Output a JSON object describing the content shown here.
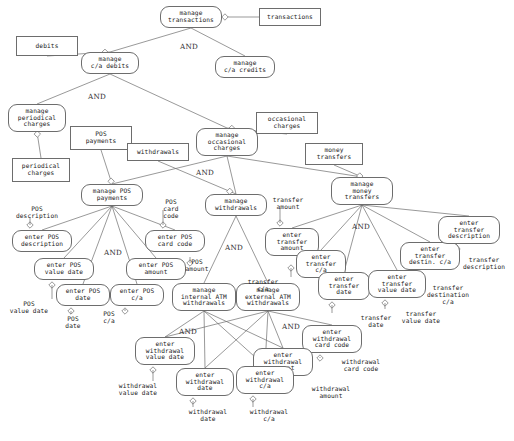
{
  "diagram": {
    "kind": "goal-decomposition-graph",
    "decomposition_operator": "AND",
    "stroke_color": "#6d6d6d",
    "text_color": "#1a1a1a",
    "background": "#ffffff"
  },
  "goals": [
    {
      "id": "g_manage_transactions",
      "label": "manage\ntransactions",
      "x": 160,
      "y": 6,
      "w": 62,
      "h": 22
    },
    {
      "id": "g_manage_ca_debits",
      "label": "manage\nc/a debits",
      "x": 81,
      "y": 52,
      "w": 58,
      "h": 22
    },
    {
      "id": "g_manage_ca_credits",
      "label": "manage\nc/a credits",
      "x": 215,
      "y": 56,
      "w": 60,
      "h": 22
    },
    {
      "id": "g_manage_periodical_charges",
      "label": "manage\nperiodical\ncharges",
      "x": 8,
      "y": 104,
      "w": 58,
      "h": 28
    },
    {
      "id": "g_manage_occasional_charges",
      "label": "manage\noccasional\ncharges",
      "x": 196,
      "y": 128,
      "w": 62,
      "h": 28
    },
    {
      "id": "g_manage_pos_payments",
      "label": "manage POS\npayments",
      "x": 81,
      "y": 184,
      "w": 62,
      "h": 22
    },
    {
      "id": "g_manage_withdrawals",
      "label": "manage\nwithdrawals",
      "x": 205,
      "y": 194,
      "w": 62,
      "h": 22
    },
    {
      "id": "g_manage_money_transfers",
      "label": "manage\nmoney\ntransfers",
      "x": 331,
      "y": 177,
      "w": 62,
      "h": 28
    },
    {
      "id": "g_enter_pos_description",
      "label": "enter POS\ndescription",
      "x": 12,
      "y": 230,
      "w": 60,
      "h": 22
    },
    {
      "id": "g_enter_pos_card_code",
      "label": "enter POS\ncard code",
      "x": 145,
      "y": 230,
      "w": 60,
      "h": 22
    },
    {
      "id": "g_enter_pos_value_date",
      "label": "enter POS\nvalue date",
      "x": 34,
      "y": 258,
      "w": 60,
      "h": 22
    },
    {
      "id": "g_enter_pos_amount",
      "label": "enter POS\namount",
      "x": 126,
      "y": 258,
      "w": 60,
      "h": 22
    },
    {
      "id": "g_enter_pos_date",
      "label": "enter POS\ndate",
      "x": 56,
      "y": 284,
      "w": 54,
      "h": 22
    },
    {
      "id": "g_enter_pos_ca",
      "label": "enter POS\nc/a",
      "x": 110,
      "y": 284,
      "w": 54,
      "h": 22
    },
    {
      "id": "g_manage_internal_atm",
      "label": "manage\ninternal ATM\nwithdrawals",
      "x": 172,
      "y": 283,
      "w": 64,
      "h": 28
    },
    {
      "id": "g_manage_external_atm",
      "label": "manage\nexternal ATM\nwithdrawals",
      "x": 236,
      "y": 283,
      "w": 64,
      "h": 28
    },
    {
      "id": "g_enter_transfer_amount",
      "label": "enter\ntransfer\namount",
      "x": 265,
      "y": 228,
      "w": 54,
      "h": 28
    },
    {
      "id": "g_enter_transfer_ca",
      "label": "enter\ntransfer\nc/a",
      "x": 296,
      "y": 250,
      "w": 50,
      "h": 28
    },
    {
      "id": "g_enter_transfer_date",
      "label": "enter\ntransfer\ndate",
      "x": 318,
      "y": 272,
      "w": 52,
      "h": 28
    },
    {
      "id": "g_enter_transfer_value_date",
      "label": "enter\ntransfer\nvalue date",
      "x": 368,
      "y": 270,
      "w": 58,
      "h": 28
    },
    {
      "id": "g_enter_transfer_destin_ca",
      "label": "enter\ntransfer\ndestin. c/a",
      "x": 400,
      "y": 242,
      "w": 60,
      "h": 28
    },
    {
      "id": "g_enter_transfer_description",
      "label": "enter\ntransfer\ndescription",
      "x": 438,
      "y": 216,
      "w": 62,
      "h": 28
    },
    {
      "id": "g_enter_withdrawal_value_date",
      "label": "enter\nwithdrawal\nvalue date",
      "x": 135,
      "y": 337,
      "w": 60,
      "h": 28
    },
    {
      "id": "g_enter_withdrawal_card_code",
      "label": "enter\nwithdrawal\ncard code",
      "x": 302,
      "y": 325,
      "w": 60,
      "h": 28
    },
    {
      "id": "g_enter_withdrawal_amount",
      "label": "enter\nwithdrawal\namount",
      "x": 253,
      "y": 348,
      "w": 60,
      "h": 28
    },
    {
      "id": "g_enter_withdrawal_date",
      "label": "enter\nwithdrawal\ndate",
      "x": 176,
      "y": 368,
      "w": 58,
      "h": 28
    },
    {
      "id": "g_enter_withdrawal_ca",
      "label": "enter\nwithdrawal\nc/a",
      "x": 236,
      "y": 366,
      "w": 58,
      "h": 28
    }
  ],
  "domain_boxes": [
    {
      "id": "d_transactions",
      "label": "transactions",
      "x": 259,
      "y": 8,
      "w": 62,
      "h": 18
    },
    {
      "id": "d_debits",
      "label": "debits",
      "x": 16,
      "y": 36,
      "w": 62,
      "h": 20
    },
    {
      "id": "d_pos_payments",
      "label": "POS\npayments",
      "x": 70,
      "y": 126,
      "w": 62,
      "h": 24
    },
    {
      "id": "d_withdrawals",
      "label": "withdrawals",
      "x": 127,
      "y": 143,
      "w": 62,
      "h": 18
    },
    {
      "id": "d_occasional_charges",
      "label": "occasional\ncharges",
      "x": 256,
      "y": 112,
      "w": 62,
      "h": 22
    },
    {
      "id": "d_money_transfers",
      "label": "money\ntransfers",
      "x": 305,
      "y": 143,
      "w": 58,
      "h": 22
    },
    {
      "id": "d_periodical_charges",
      "label": "periodical\ncharges",
      "x": 12,
      "y": 158,
      "w": 58,
      "h": 24
    }
  ],
  "resource_labels": [
    {
      "id": "r_pos_description",
      "label": "POS\ndescription",
      "x": 6,
      "y": 205,
      "w": 62
    },
    {
      "id": "r_pos_card_code",
      "label": "POS\ncard\ncode",
      "x": 151,
      "y": 198,
      "w": 40
    },
    {
      "id": "r_pos_amount",
      "label": "POS\namount",
      "x": 180,
      "y": 258,
      "w": 34
    },
    {
      "id": "r_pos_value_date",
      "label": "POS\nvalue date",
      "x": 2,
      "y": 300,
      "w": 54
    },
    {
      "id": "r_pos_date",
      "label": "POS\ndate",
      "x": 57,
      "y": 315,
      "w": 32
    },
    {
      "id": "r_pos_ca",
      "label": "POS\nc/a",
      "x": 93,
      "y": 310,
      "w": 32
    },
    {
      "id": "r_transfer_amount",
      "label": "transfer\namount",
      "x": 264,
      "y": 196,
      "w": 48
    },
    {
      "id": "r_transfer_ca",
      "label": "transfer\nc/a",
      "x": 241,
      "y": 278,
      "w": 44
    },
    {
      "id": "r_transfer_date",
      "label": "transfer\ndate",
      "x": 353,
      "y": 314,
      "w": 46
    },
    {
      "id": "r_transfer_value_date",
      "label": "transfer\nvalue date",
      "x": 395,
      "y": 310,
      "w": 52
    },
    {
      "id": "r_transfer_destination_ca",
      "label": "transfer\ndestination\nc/a",
      "x": 419,
      "y": 284,
      "w": 58
    },
    {
      "id": "r_transfer_description",
      "label": "transfer\ndescription",
      "x": 456,
      "y": 256,
      "w": 56
    },
    {
      "id": "r_withdrawal_value_date",
      "label": "withdrawal\nvalue date",
      "x": 107,
      "y": 382,
      "w": 62
    },
    {
      "id": "r_withdrawal_card_code",
      "label": "withdrawal\ncard code",
      "x": 330,
      "y": 358,
      "w": 62
    },
    {
      "id": "r_withdrawal_amount",
      "label": "withdrawal\namount",
      "x": 300,
      "y": 385,
      "w": 62
    },
    {
      "id": "r_withdrawal_date",
      "label": "withdrawal\ndate",
      "x": 177,
      "y": 408,
      "w": 62
    },
    {
      "id": "r_withdrawal_ca",
      "label": "withdrawal\nc/a",
      "x": 240,
      "y": 408,
      "w": 58
    }
  ],
  "and_markers": [
    {
      "id": "and_transactions",
      "label": "AND",
      "x": 180,
      "y": 42
    },
    {
      "id": "and_ca_debits",
      "label": "AND",
      "x": 88,
      "y": 92
    },
    {
      "id": "and_occasional",
      "label": "AND",
      "x": 196,
      "y": 168
    },
    {
      "id": "and_pos_payments",
      "label": "AND",
      "x": 104,
      "y": 248
    },
    {
      "id": "and_withdrawals",
      "label": "AND",
      "x": 225,
      "y": 243
    },
    {
      "id": "and_money",
      "label": "AND",
      "x": 352,
      "y": 222
    },
    {
      "id": "and_internal_atm",
      "label": "AND",
      "x": 179,
      "y": 327
    },
    {
      "id": "and_external_atm",
      "label": "AND",
      "x": 282,
      "y": 322
    }
  ],
  "edges": [
    {
      "from": "g_manage_transactions",
      "to": "g_manage_ca_debits"
    },
    {
      "from": "g_manage_transactions",
      "to": "g_manage_ca_credits"
    },
    {
      "from": "g_manage_ca_debits",
      "to": "g_manage_periodical_charges"
    },
    {
      "from": "g_manage_ca_debits",
      "to": "g_manage_occasional_charges"
    },
    {
      "from": "g_manage_occasional_charges",
      "to": "g_manage_pos_payments"
    },
    {
      "from": "g_manage_occasional_charges",
      "to": "g_manage_withdrawals"
    },
    {
      "from": "g_manage_occasional_charges",
      "to": "g_manage_money_transfers"
    },
    {
      "from": "g_manage_pos_payments",
      "to": "g_enter_pos_description"
    },
    {
      "from": "g_manage_pos_payments",
      "to": "g_enter_pos_card_code"
    },
    {
      "from": "g_manage_pos_payments",
      "to": "g_enter_pos_value_date"
    },
    {
      "from": "g_manage_pos_payments",
      "to": "g_enter_pos_amount"
    },
    {
      "from": "g_manage_pos_payments",
      "to": "g_enter_pos_date"
    },
    {
      "from": "g_manage_pos_payments",
      "to": "g_enter_pos_ca"
    },
    {
      "from": "g_manage_withdrawals",
      "to": "g_manage_internal_atm"
    },
    {
      "from": "g_manage_withdrawals",
      "to": "g_manage_external_atm"
    },
    {
      "from": "g_manage_money_transfers",
      "to": "g_enter_transfer_amount"
    },
    {
      "from": "g_manage_money_transfers",
      "to": "g_enter_transfer_ca"
    },
    {
      "from": "g_manage_money_transfers",
      "to": "g_enter_transfer_date"
    },
    {
      "from": "g_manage_money_transfers",
      "to": "g_enter_transfer_value_date"
    },
    {
      "from": "g_manage_money_transfers",
      "to": "g_enter_transfer_destin_ca"
    },
    {
      "from": "g_manage_money_transfers",
      "to": "g_enter_transfer_description"
    },
    {
      "from": "g_manage_internal_atm",
      "to": "g_enter_withdrawal_value_date"
    },
    {
      "from": "g_manage_internal_atm",
      "to": "g_enter_withdrawal_date"
    },
    {
      "from": "g_manage_internal_atm",
      "to": "g_enter_withdrawal_ca"
    },
    {
      "from": "g_manage_internal_atm",
      "to": "g_enter_withdrawal_amount"
    },
    {
      "from": "g_manage_external_atm",
      "to": "g_enter_withdrawal_value_date"
    },
    {
      "from": "g_manage_external_atm",
      "to": "g_enter_withdrawal_date"
    },
    {
      "from": "g_manage_external_atm",
      "to": "g_enter_withdrawal_ca"
    },
    {
      "from": "g_manage_external_atm",
      "to": "g_enter_withdrawal_amount"
    },
    {
      "from": "g_manage_external_atm",
      "to": "g_enter_withdrawal_card_code"
    }
  ]
}
